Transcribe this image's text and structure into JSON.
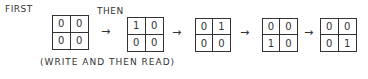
{
  "labels": {
    "first": "FIRST",
    "then": "THEN"
  },
  "caption": "(WRITE AND THEN READ)",
  "arrow": "→",
  "grids": [
    {
      "cells": [
        "0",
        "0",
        "0",
        "0"
      ]
    },
    {
      "cells": [
        "1",
        "0",
        "0",
        "0"
      ]
    },
    {
      "cells": [
        "0",
        "1",
        "0",
        "0"
      ]
    },
    {
      "cells": [
        "0",
        "0",
        "1",
        "0"
      ]
    },
    {
      "cells": [
        "0",
        "0",
        "0",
        "1"
      ]
    }
  ]
}
